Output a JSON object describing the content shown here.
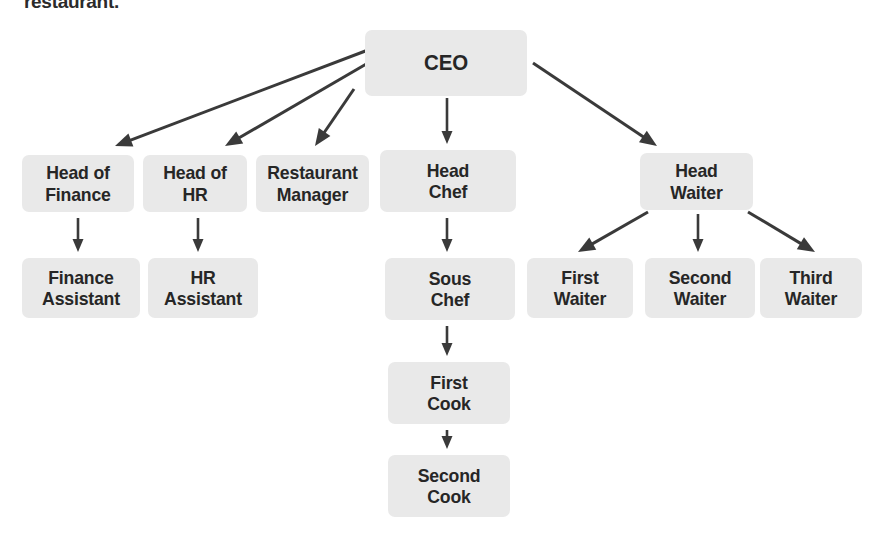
{
  "caption": "restaurant.",
  "colors": {
    "node_fill": "#e9e9e9",
    "node_text": "#262626",
    "arrow": "#3a3a3a",
    "background": "#ffffff"
  },
  "chart_data": {
    "type": "diagram",
    "subtype": "organizational-chart",
    "title": "restaurant.",
    "orientation": "top-down",
    "nodes": [
      {
        "id": "ceo",
        "label": "CEO",
        "level": 0,
        "x": 365,
        "y": 30,
        "w": 162,
        "h": 66
      },
      {
        "id": "head_finance",
        "label": "Head of\nFinance",
        "level": 1,
        "x": 22,
        "y": 155,
        "w": 112,
        "h": 57
      },
      {
        "id": "head_hr",
        "label": "Head of\nHR",
        "level": 1,
        "x": 143,
        "y": 155,
        "w": 104,
        "h": 57
      },
      {
        "id": "rest_manager",
        "label": "Restaurant\nManager",
        "level": 1,
        "x": 256,
        "y": 155,
        "w": 113,
        "h": 57
      },
      {
        "id": "head_chef",
        "label": "Head\nChef",
        "level": 1,
        "x": 380,
        "y": 150,
        "w": 136,
        "h": 62
      },
      {
        "id": "head_waiter",
        "label": "Head\nWaiter",
        "level": 1,
        "x": 640,
        "y": 153,
        "w": 113,
        "h": 57
      },
      {
        "id": "finance_asst",
        "label": "Finance\nAssistant",
        "level": 2,
        "x": 22,
        "y": 258,
        "w": 118,
        "h": 60
      },
      {
        "id": "hr_asst",
        "label": "HR\nAssistant",
        "level": 2,
        "x": 148,
        "y": 258,
        "w": 110,
        "h": 60
      },
      {
        "id": "sous_chef",
        "label": "Sous\nChef",
        "level": 2,
        "x": 385,
        "y": 258,
        "w": 130,
        "h": 62
      },
      {
        "id": "first_waiter",
        "label": "First\nWaiter",
        "level": 2,
        "x": 527,
        "y": 258,
        "w": 106,
        "h": 60
      },
      {
        "id": "second_waiter",
        "label": "Second\nWaiter",
        "level": 2,
        "x": 645,
        "y": 258,
        "w": 110,
        "h": 60
      },
      {
        "id": "third_waiter",
        "label": "Third\nWaiter",
        "level": 2,
        "x": 760,
        "y": 258,
        "w": 102,
        "h": 60
      },
      {
        "id": "first_cook",
        "label": "First\nCook",
        "level": 3,
        "x": 388,
        "y": 362,
        "w": 122,
        "h": 62
      },
      {
        "id": "second_cook",
        "label": "Second\nCook",
        "level": 4,
        "x": 388,
        "y": 455,
        "w": 122,
        "h": 62
      }
    ],
    "edges": [
      {
        "from": "ceo",
        "to": "head_finance",
        "x1": 368,
        "y1": 50,
        "x2": 115,
        "y2": 146,
        "style": "diagonal"
      },
      {
        "from": "ceo",
        "to": "head_hr",
        "x1": 368,
        "y1": 63,
        "x2": 225,
        "y2": 146,
        "style": "diagonal"
      },
      {
        "from": "ceo",
        "to": "rest_manager",
        "x1": 354,
        "y1": 89,
        "x2": 315,
        "y2": 146,
        "style": "diagonal"
      },
      {
        "from": "ceo",
        "to": "head_chef",
        "x1": 447,
        "y1": 98,
        "x2": 447,
        "y2": 144,
        "style": "vertical"
      },
      {
        "from": "ceo",
        "to": "head_waiter",
        "x1": 533,
        "y1": 63,
        "x2": 657,
        "y2": 146,
        "style": "diagonal"
      },
      {
        "from": "head_finance",
        "to": "finance_asst",
        "x1": 78,
        "y1": 218,
        "x2": 78,
        "y2": 252,
        "style": "vertical"
      },
      {
        "from": "head_hr",
        "to": "hr_asst",
        "x1": 198,
        "y1": 218,
        "x2": 198,
        "y2": 252,
        "style": "vertical"
      },
      {
        "from": "head_chef",
        "to": "sous_chef",
        "x1": 447,
        "y1": 218,
        "x2": 447,
        "y2": 252,
        "style": "vertical"
      },
      {
        "from": "sous_chef",
        "to": "first_cook",
        "x1": 447,
        "y1": 326,
        "x2": 447,
        "y2": 356,
        "style": "vertical"
      },
      {
        "from": "first_cook",
        "to": "second_cook",
        "x1": 447,
        "y1": 430,
        "x2": 447,
        "y2": 449,
        "style": "vertical"
      },
      {
        "from": "head_waiter",
        "to": "first_waiter",
        "x1": 648,
        "y1": 212,
        "x2": 578,
        "y2": 252,
        "style": "diagonal"
      },
      {
        "from": "head_waiter",
        "to": "second_waiter",
        "x1": 698,
        "y1": 214,
        "x2": 698,
        "y2": 252,
        "style": "vertical"
      },
      {
        "from": "head_waiter",
        "to": "third_waiter",
        "x1": 748,
        "y1": 212,
        "x2": 815,
        "y2": 252,
        "style": "diagonal"
      }
    ]
  }
}
